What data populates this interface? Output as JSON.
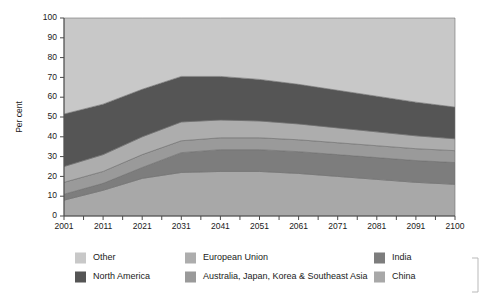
{
  "chart_data": {
    "type": "area",
    "stacked": true,
    "title": "",
    "xlabel": "",
    "ylabel": "Per cent",
    "ylim": [
      0,
      100
    ],
    "yticks": [
      0,
      10,
      20,
      30,
      40,
      50,
      60,
      70,
      80,
      90,
      100
    ],
    "grid": false,
    "legend_position": "bottom",
    "x": [
      2001,
      2011,
      2021,
      2031,
      2041,
      2051,
      2061,
      2071,
      2081,
      2091,
      2100
    ],
    "xtick_labels": [
      "2001",
      "2011",
      "2021",
      "2031",
      "2041",
      "2051",
      "2061",
      "2071",
      "2081",
      "2091",
      "2100"
    ],
    "stack_order_bottom_to_top": [
      "China",
      "India",
      "Australia, Japan, Korea & Southeast Asia",
      "European Union",
      "North America",
      "Other"
    ],
    "series": [
      {
        "name": "China",
        "color": "#a8a8a8",
        "values": [
          8,
          13,
          19,
          22,
          22.5,
          22.5,
          21.5,
          20,
          18.5,
          17,
          16
        ]
      },
      {
        "name": "India",
        "color": "#7d7d7d",
        "values": [
          3,
          3.5,
          5.5,
          10,
          11,
          11,
          11,
          11,
          11,
          11,
          11
        ]
      },
      {
        "name": "Australia, Japan, Korea & Southeast Asia",
        "color": "#9a9a9a",
        "values": [
          6,
          6,
          6.5,
          6,
          6,
          6,
          6,
          6,
          6,
          6,
          6
        ]
      },
      {
        "name": "European Union",
        "color": "#adadad",
        "values": [
          8,
          8.5,
          9,
          9.5,
          9,
          8.5,
          8,
          7.5,
          7,
          6.5,
          6
        ]
      },
      {
        "name": "North America",
        "color": "#555555",
        "values": [
          26.5,
          25.5,
          24,
          23,
          22,
          21,
          20,
          19,
          18,
          17,
          16
        ]
      },
      {
        "name": "Other",
        "color": "#c8c8c8",
        "values": [
          48.5,
          43.5,
          36,
          29.5,
          29.5,
          31,
          33.5,
          36.5,
          39.5,
          42.5,
          45
        ]
      }
    ],
    "legend": [
      {
        "label": "Other",
        "color": "#c8c8c8"
      },
      {
        "label": "European Union",
        "color": "#adadad"
      },
      {
        "label": "India",
        "color": "#7d7d7d"
      },
      {
        "label": "North America",
        "color": "#555555"
      },
      {
        "label": "Australia, Japan, Korea & Southeast Asia",
        "color": "#9a9a9a"
      },
      {
        "label": "China",
        "color": "#a8a8a8"
      }
    ]
  }
}
